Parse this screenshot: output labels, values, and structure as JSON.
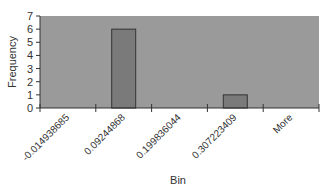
{
  "chart_data": {
    "type": "bar",
    "title": "",
    "xlabel": "Bin",
    "ylabel": "Frequency",
    "categories": [
      "-0.014938685",
      "0.09244868",
      "0.199836044",
      "0.307223409",
      "More"
    ],
    "values": [
      0,
      6,
      0,
      1,
      0
    ],
    "ylim": [
      0,
      7
    ],
    "yticks": [
      0,
      1,
      2,
      3,
      4,
      5,
      6,
      7
    ],
    "grid": false,
    "legend": "none",
    "colors": {
      "plot_background": "#9a9a9a",
      "bar_fill": "#7a7a7a",
      "bar_stroke": "#333333",
      "axis": "#333333",
      "page_background": "#ffffff"
    }
  },
  "axis": {
    "x_title": "Bin",
    "y_title": "Frequency"
  }
}
